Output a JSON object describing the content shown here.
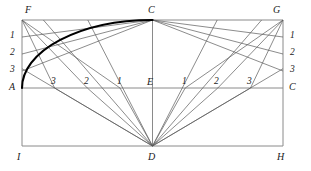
{
  "figure": {
    "type": "geometry-construction-diagram",
    "background_color": "#ffffff",
    "line_color": "#4a4a4a",
    "frame_color": "#8a8a8a",
    "arc_color": "#000000",
    "width": 311,
    "height": 171
  },
  "vertices": {
    "F": {
      "label": "F",
      "x": 22,
      "y": 20,
      "lx": 25,
      "ly": 5
    },
    "G": {
      "label": "G",
      "x": 283,
      "y": 20,
      "lx": 273,
      "ly": 5
    },
    "C_top": {
      "label": "C",
      "x": 152.5,
      "y": 20,
      "lx": 148,
      "ly": 5
    },
    "A": {
      "label": "A",
      "x": 22,
      "y": 88,
      "lx": 9,
      "ly": 82
    },
    "C_right": {
      "label": "C",
      "x": 283,
      "y": 88,
      "lx": 289,
      "ly": 82
    },
    "E": {
      "label": "E",
      "x": 152.5,
      "y": 88,
      "lx": 147,
      "ly": 77
    },
    "I": {
      "label": "I",
      "x": 22,
      "y": 146,
      "lx": 17,
      "ly": 152
    },
    "H": {
      "label": "H",
      "x": 283,
      "y": 146,
      "lx": 277,
      "ly": 152
    },
    "D": {
      "label": "D",
      "x": 152.5,
      "y": 146,
      "lx": 148,
      "ly": 152
    }
  },
  "left_ticks": [
    {
      "label": "1",
      "x": 22,
      "y": 37,
      "lx": 10,
      "ly": 31
    },
    {
      "label": "2",
      "x": 22,
      "y": 54,
      "lx": 10,
      "ly": 48
    },
    {
      "label": "3",
      "x": 22,
      "y": 71,
      "lx": 10,
      "ly": 65
    }
  ],
  "right_ticks": [
    {
      "label": "1",
      "x": 283,
      "y": 37,
      "lx": 290,
      "ly": 31
    },
    {
      "label": "2",
      "x": 283,
      "y": 54,
      "lx": 290,
      "ly": 48
    },
    {
      "label": "3",
      "x": 283,
      "y": 71,
      "lx": 290,
      "ly": 65
    }
  ],
  "base_ticks_left": [
    {
      "label": "3",
      "x": 54.6,
      "y": 88,
      "lx": 51,
      "ly": 77
    },
    {
      "label": "2",
      "x": 87.3,
      "y": 88,
      "lx": 84,
      "ly": 77
    },
    {
      "label": "1",
      "x": 120.0,
      "y": 88,
      "lx": 117,
      "ly": 77
    }
  ],
  "base_ticks_right": [
    {
      "label": "1",
      "x": 185.2,
      "y": 88,
      "lx": 182,
      "ly": 77
    },
    {
      "label": "2",
      "x": 217.8,
      "y": 88,
      "lx": 214,
      "ly": 77
    },
    {
      "label": "3",
      "x": 250.5,
      "y": 88,
      "lx": 247,
      "ly": 77
    }
  ],
  "arc": {
    "name": "ellipse-quarter-arc",
    "from": "A",
    "to": "C_top",
    "rx": 130.5,
    "ry": 68,
    "stroke_width": 2.1
  },
  "frame_lines": [
    {
      "name": "top-edge-FG",
      "x1": 22,
      "y1": 20,
      "x2": 283,
      "y2": 20
    },
    {
      "name": "left-edge-FI",
      "x1": 22,
      "y1": 20,
      "x2": 22,
      "y2": 146
    },
    {
      "name": "right-edge-GH",
      "x1": 283,
      "y1": 20,
      "x2": 283,
      "y2": 146
    },
    {
      "name": "bottom-edge-IH",
      "x1": 22,
      "y1": 146,
      "x2": 283,
      "y2": 146
    },
    {
      "name": "spring-line-AC",
      "x1": 22,
      "y1": 88,
      "x2": 283,
      "y2": 88
    },
    {
      "name": "center-line-CD",
      "x1": 152.5,
      "y1": 20,
      "x2": 152.5,
      "y2": 146
    }
  ],
  "rays_from_C": [
    {
      "name": "C-to-left-1",
      "x1": 152.5,
      "y1": 20,
      "x2": 22,
      "y2": 37
    },
    {
      "name": "C-to-left-2",
      "x1": 152.5,
      "y1": 20,
      "x2": 22,
      "y2": 54
    },
    {
      "name": "C-to-left-3",
      "x1": 152.5,
      "y1": 20,
      "x2": 22,
      "y2": 71
    },
    {
      "name": "C-to-right-1",
      "x1": 152.5,
      "y1": 20,
      "x2": 283,
      "y2": 37
    },
    {
      "name": "C-to-right-2",
      "x1": 152.5,
      "y1": 20,
      "x2": 283,
      "y2": 54
    },
    {
      "name": "C-to-right-3",
      "x1": 152.5,
      "y1": 20,
      "x2": 283,
      "y2": 71
    }
  ],
  "rays_from_D": [
    {
      "name": "D-to-base-left-3",
      "x1": 152.5,
      "y1": 146,
      "x2": 54.6,
      "y2": 88
    },
    {
      "name": "D-to-base-left-2",
      "x1": 152.5,
      "y1": 146,
      "x2": 87.3,
      "y2": 88
    },
    {
      "name": "D-to-base-left-1",
      "x1": 152.5,
      "y1": 146,
      "x2": 120.0,
      "y2": 88
    },
    {
      "name": "D-to-base-right-1",
      "x1": 152.5,
      "y1": 146,
      "x2": 185.2,
      "y2": 88
    },
    {
      "name": "D-to-base-right-2",
      "x1": 152.5,
      "y1": 146,
      "x2": 217.8,
      "y2": 88
    },
    {
      "name": "D-to-base-right-3",
      "x1": 152.5,
      "y1": 146,
      "x2": 250.5,
      "y2": 88
    }
  ],
  "rays_extended": [
    {
      "name": "D-through-left-3-to-top",
      "x1": 152.5,
      "y1": 146,
      "x2": 22,
      "y2": 68.7
    },
    {
      "name": "D-through-left-2-to-top",
      "x1": 152.5,
      "y1": 146,
      "x2": 43.4,
      "y2": 20
    },
    {
      "name": "D-through-left-1-to-top",
      "x1": 152.5,
      "y1": 146,
      "x2": 87.8,
      "y2": 20
    },
    {
      "name": "D-through-right-1-to-top",
      "x1": 152.5,
      "y1": 146,
      "x2": 217.2,
      "y2": 20
    },
    {
      "name": "D-through-right-2-to-top",
      "x1": 152.5,
      "y1": 146,
      "x2": 261.6,
      "y2": 20
    },
    {
      "name": "D-through-right-3-to-side",
      "x1": 152.5,
      "y1": 146,
      "x2": 283,
      "y2": 68.7
    }
  ],
  "rays_from_F": [
    {
      "name": "F-to-base-3",
      "x1": 22,
      "y1": 20,
      "x2": 54.6,
      "y2": 88
    },
    {
      "name": "F-to-base-2",
      "x1": 22,
      "y1": 20,
      "x2": 87.3,
      "y2": 88
    },
    {
      "name": "F-to-base-1",
      "x1": 22,
      "y1": 20,
      "x2": 120.0,
      "y2": 88
    }
  ],
  "rays_from_G": [
    {
      "name": "G-to-base-3",
      "x1": 283,
      "y1": 20,
      "x2": 250.5,
      "y2": 88
    },
    {
      "name": "G-to-base-2",
      "x1": 283,
      "y1": 20,
      "x2": 217.8,
      "y2": 88
    },
    {
      "name": "G-to-base-1",
      "x1": 283,
      "y1": 20,
      "x2": 185.2,
      "y2": 88
    }
  ]
}
